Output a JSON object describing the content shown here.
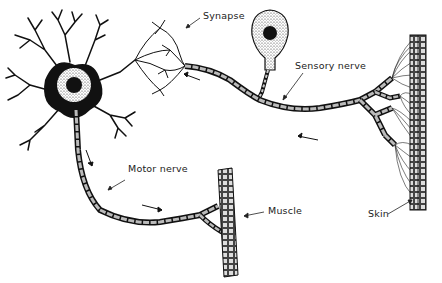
{
  "diagram": {
    "labels": {
      "synapse": "Synapse",
      "sensory_nerve": "Sensory nerve",
      "motor_nerve": "Motor nerve",
      "muscle": "Muscle",
      "skin": "Skin"
    },
    "colors": {
      "ink": "#111111",
      "background": "#ffffff",
      "text": "#222222"
    }
  }
}
